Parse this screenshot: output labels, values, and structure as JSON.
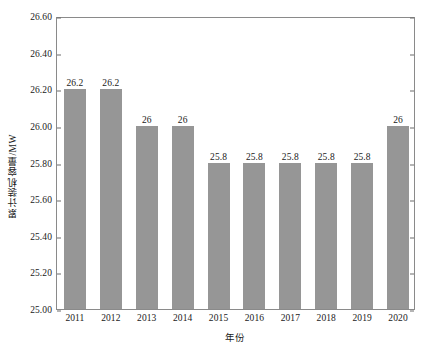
{
  "chart_data": {
    "type": "bar",
    "title": "",
    "categories": [
      "2011",
      "2012",
      "2013",
      "2014",
      "2015",
      "2016",
      "2017",
      "2018",
      "2019",
      "2020"
    ],
    "values": [
      26.2,
      26.2,
      26,
      26,
      25.8,
      25.8,
      25.8,
      25.8,
      25.8,
      26
    ],
    "data_labels": [
      "26.2",
      "26.2",
      "26",
      "26",
      "25.8",
      "25.8",
      "25.8",
      "25.8",
      "25.8",
      "26"
    ],
    "xlabel": "年份",
    "ylabel": "累计装机容量/MW",
    "ylim": [
      25.0,
      26.6
    ],
    "ytick_labels": [
      "25.00",
      "25.20",
      "25.40",
      "25.60",
      "25.80",
      "26.00",
      "26.20",
      "26.40",
      "26.60"
    ],
    "ytick_values": [
      25.0,
      25.2,
      25.4,
      25.6,
      25.8,
      26.0,
      26.2,
      26.4,
      26.6
    ],
    "grid": false,
    "legend": null,
    "bar_color": "#969696",
    "frame_color": "#8a8a8a",
    "background": "#ffffff"
  }
}
